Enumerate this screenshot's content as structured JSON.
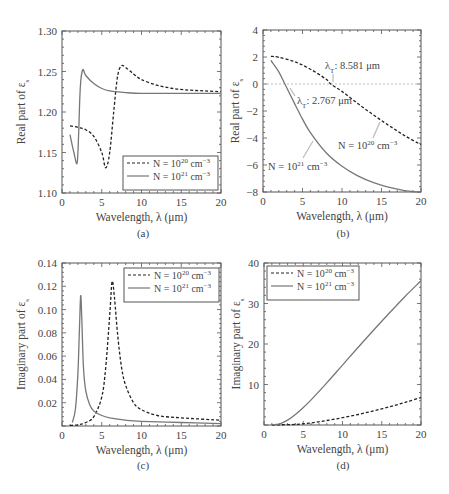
{
  "figure": {
    "panels": [
      {
        "id": "a",
        "caption": "(a)"
      },
      {
        "id": "b",
        "caption": "(b)"
      },
      {
        "id": "c",
        "caption": "(c)"
      },
      {
        "id": "d",
        "caption": "(d)"
      }
    ]
  },
  "chart_data": [
    {
      "panel": "(a)",
      "type": "line",
      "title": "",
      "xlabel": "Wavelength, λ (μm)",
      "ylabel": "Real part of ε_s",
      "xlim": [
        0,
        20
      ],
      "ylim": [
        1.1,
        1.3
      ],
      "xticks": [
        0,
        5,
        10,
        15,
        20
      ],
      "yticks": [
        "1.10",
        "1.15",
        "1.20",
        "1.25",
        "1.30"
      ],
      "grid": false,
      "legend_position": "lower right",
      "series": [
        {
          "name": "N = 10^20 cm^-3",
          "style": "dashed",
          "x": [
            1.0,
            2.0,
            3.0,
            4.0,
            5.0,
            5.5,
            6.0,
            6.5,
            7.0,
            7.5,
            8.0,
            9.0,
            10,
            12,
            14,
            16,
            18,
            20
          ],
          "y": [
            1.183,
            1.181,
            1.178,
            1.17,
            1.15,
            1.131,
            1.15,
            1.2,
            1.245,
            1.257,
            1.255,
            1.247,
            1.24,
            1.233,
            1.229,
            1.227,
            1.226,
            1.225
          ]
        },
        {
          "name": "N = 10^21 cm^-3",
          "style": "solid",
          "x": [
            1.0,
            1.5,
            1.9,
            2.1,
            2.3,
            2.6,
            3.0,
            4.0,
            5.0,
            6.0,
            8.0,
            10,
            15,
            20
          ],
          "y": [
            1.172,
            1.15,
            1.137,
            1.175,
            1.23,
            1.252,
            1.245,
            1.235,
            1.229,
            1.226,
            1.224,
            1.223,
            1.223,
            1.223
          ]
        }
      ]
    },
    {
      "panel": "(b)",
      "type": "line",
      "title": "",
      "xlabel": "Wavelength, λ (μm)",
      "ylabel": "Real part of ε_s",
      "xlim": [
        0,
        20
      ],
      "ylim": [
        -8,
        4
      ],
      "xticks": [
        0,
        5,
        10,
        15,
        20
      ],
      "yticks": [
        "−8",
        "−6",
        "−4",
        "−2",
        "0",
        "2",
        "4"
      ],
      "grid": false,
      "reference_line": {
        "y": 0,
        "style": "dotted"
      },
      "annotations": [
        {
          "text": "λ_T: 8.581 μm",
          "x": 8.581,
          "y": 0
        },
        {
          "text": "λ_T: 2.767 μm",
          "x": 2.767,
          "y": 0
        },
        {
          "text": "N = 10^20 cm^-3",
          "target_series": 0
        },
        {
          "text": "N = 10^21 cm^-3",
          "target_series": 1
        }
      ],
      "series": [
        {
          "name": "N = 10^20 cm^-3",
          "style": "dashed",
          "x": [
            1,
            2,
            4,
            6,
            8,
            8.581,
            10,
            12,
            14,
            16,
            18,
            20
          ],
          "y": [
            2.05,
            1.98,
            1.65,
            1.1,
            0.35,
            0.0,
            -0.55,
            -1.45,
            -2.3,
            -3.1,
            -3.85,
            -4.5
          ]
        },
        {
          "name": "N = 10^21 cm^-3",
          "style": "solid",
          "x": [
            1,
            2,
            2.767,
            4,
            5,
            6,
            8,
            10,
            12,
            14,
            16,
            18,
            19,
            20
          ],
          "y": [
            1.75,
            0.9,
            0.0,
            -1.45,
            -2.6,
            -3.6,
            -5.1,
            -6.1,
            -6.8,
            -7.3,
            -7.65,
            -7.9,
            -7.97,
            -8.0
          ]
        }
      ]
    },
    {
      "panel": "(c)",
      "type": "line",
      "title": "",
      "xlabel": "Wavelength, λ (μm)",
      "ylabel": "Imaginary part of ε_s",
      "xlim": [
        0,
        20
      ],
      "ylim": [
        0,
        0.14
      ],
      "xticks": [
        0,
        5,
        10,
        15,
        20
      ],
      "yticks": [
        "0.02",
        "0.04",
        "0.06",
        "0.08",
        "0.10",
        "0.12",
        "0.14"
      ],
      "grid": false,
      "legend_position": "upper right",
      "series": [
        {
          "name": "N = 10^20 cm^-3",
          "style": "dashed",
          "x": [
            1.0,
            2.0,
            3.0,
            4.0,
            5.0,
            5.5,
            6.0,
            6.3,
            6.6,
            7.0,
            7.5,
            8.0,
            9.0,
            10,
            12,
            15,
            20
          ],
          "y": [
            0.0005,
            0.001,
            0.003,
            0.008,
            0.025,
            0.05,
            0.095,
            0.124,
            0.11,
            0.078,
            0.05,
            0.035,
            0.02,
            0.014,
            0.009,
            0.007,
            0.005
          ]
        },
        {
          "name": "N = 10^21 cm^-3",
          "style": "solid",
          "x": [
            1.3,
            1.7,
            2.0,
            2.2,
            2.35,
            2.5,
            2.7,
            3.0,
            3.5,
            4.0,
            5.0,
            6.0,
            8.0,
            10,
            15,
            20
          ],
          "y": [
            0.003,
            0.015,
            0.045,
            0.085,
            0.112,
            0.09,
            0.05,
            0.03,
            0.018,
            0.013,
            0.009,
            0.007,
            0.005,
            0.004,
            0.003,
            0.002
          ]
        }
      ]
    },
    {
      "panel": "(d)",
      "type": "line",
      "title": "",
      "xlabel": "Wavelength, λ (μm)",
      "ylabel": "Imaginary part of ε_s",
      "xlim": [
        0,
        20
      ],
      "ylim": [
        0,
        40
      ],
      "xticks": [
        0,
        5,
        10,
        15,
        20
      ],
      "yticks": [
        "10",
        "20",
        "30",
        "40"
      ],
      "grid": false,
      "legend_position": "upper left",
      "series": [
        {
          "name": "N = 10^20 cm^-3",
          "style": "dashed",
          "x": [
            1,
            2,
            4,
            6,
            8,
            10,
            12,
            14,
            16,
            18,
            20
          ],
          "y": [
            0.0,
            0.05,
            0.15,
            0.5,
            1.1,
            1.8,
            2.6,
            3.5,
            4.5,
            5.6,
            6.8
          ]
        },
        {
          "name": "N = 10^21 cm^-3",
          "style": "solid",
          "x": [
            1,
            2,
            3,
            4,
            5,
            6,
            8,
            10,
            12,
            14,
            16,
            18,
            20
          ],
          "y": [
            0.05,
            0.3,
            1.2,
            2.6,
            4.3,
            6.2,
            10.4,
            14.8,
            19.2,
            23.5,
            27.7,
            31.8,
            35.6
          ]
        }
      ]
    }
  ],
  "legend": {
    "entries": [
      "N = 10",
      "N = 10"
    ],
    "exponents": [
      "20",
      "21"
    ],
    "unit": " cm",
    "unit_exp": "−3"
  },
  "labels": {
    "xlabel": "Wavelength, λ (μm)",
    "real_ylabel": "Real part of ε",
    "imag_ylabel": "Imaginary part of ε",
    "subscript": "s",
    "lambda_t_a": "λ",
    "lambda_t_sub": "T",
    "lambda_t_val_1": ": 8.581 μm",
    "lambda_t_val_2": ": 2.767 μm",
    "annot_n20": "N = 10",
    "annot_n21": "N = 10"
  }
}
